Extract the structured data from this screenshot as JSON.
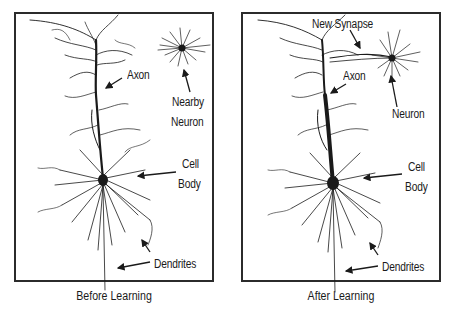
{
  "figure": {
    "panels": [
      {
        "id": "before",
        "caption": "Before Learning",
        "labels": {
          "axon": "Axon",
          "nearby_neuron_line1": "Nearby",
          "nearby_neuron_line2": "Neuron",
          "cell_line1": "Cell",
          "cell_line2": "Body",
          "dendrites": "Dendrites"
        }
      },
      {
        "id": "after",
        "caption": "After Learning",
        "labels": {
          "new_synapse": "New Synapse",
          "axon": "Axon",
          "neuron": "Neuron",
          "cell_line1": "Cell",
          "cell_line2": "Body",
          "dendrites": "Dendrites"
        }
      }
    ],
    "colors": {
      "ink": "#1a1a1a",
      "frame": "#2b2b2b",
      "background": "#ffffff"
    }
  }
}
